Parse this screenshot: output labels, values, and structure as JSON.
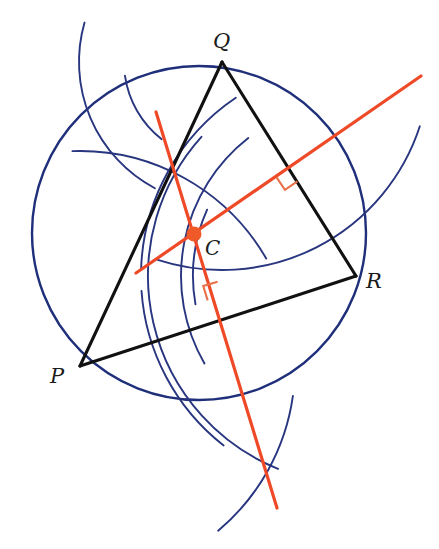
{
  "figure": {
    "background": "#ffffff",
    "width": 439,
    "height": 549,
    "colors": {
      "triangle_stroke": "#111111",
      "circle_stroke": "#1f2f7a",
      "arc_stroke": "#28357f",
      "bisector_stroke": "#ef4a28",
      "center_dot_fill": "#f05a28",
      "right_angle_stroke": "#e8714a",
      "label_fill": "#1b1b1b"
    }
  },
  "labels": {
    "vertex_p": "P",
    "vertex_q": "Q",
    "vertex_r": "R",
    "center": "C"
  },
  "chart_data": {
    "type": "diagram",
    "points": {
      "P": {
        "x": 80,
        "y": 366
      },
      "Q": {
        "x": 222,
        "y": 62
      },
      "R": {
        "x": 356,
        "y": 276
      },
      "C": {
        "x": 194,
        "y": 234
      }
    },
    "label_positions": {
      "P": {
        "x": 50,
        "y": 383
      },
      "Q": {
        "x": 213,
        "y": 48
      },
      "R": {
        "x": 366,
        "y": 288
      },
      "C": {
        "x": 205,
        "y": 255
      }
    },
    "circumcircle": {
      "cx": 199,
      "cy": 233,
      "r": 167,
      "stroke": "#1f2f7a",
      "stroke_width": 2.4
    },
    "triangle_sides": [
      {
        "name": "PQ",
        "from": "P",
        "to": "Q"
      },
      {
        "name": "QR",
        "from": "Q",
        "to": "R"
      },
      {
        "name": "PR",
        "from": "P",
        "to": "R"
      }
    ],
    "perpendicular_bisectors": [
      {
        "name": "bisector-of-QR",
        "bisects": "QR",
        "x1": 136,
        "y1": 273,
        "x2": 421,
        "y2": 76,
        "stroke": "#ef4a28",
        "stroke_width": 3.2
      },
      {
        "name": "bisector-of-PR",
        "bisects": "PR",
        "x1": 156,
        "y1": 112,
        "x2": 277,
        "y2": 508,
        "stroke": "#ef4a28",
        "stroke_width": 3.2
      }
    ],
    "right_angle_markers": [
      {
        "name": "right-angle-on-QR",
        "vertex_x": 289,
        "vertex_y": 169,
        "size": 15,
        "rotation": -34
      },
      {
        "name": "right-angle-on-PR",
        "vertex_x": 222,
        "vertex_y": 296,
        "size": 15,
        "rotation": 73
      }
    ],
    "construction_arcs": [
      {
        "name": "arc-from-Q-large",
        "cx": 222,
        "cy": 62,
        "r": 208,
        "start_deg": 18,
        "end_deg": 108
      },
      {
        "name": "arc-from-R-large",
        "cx": 356,
        "cy": 276,
        "r": 208,
        "start_deg": 112,
        "end_deg": 222
      },
      {
        "name": "arc-from-Q-small",
        "cx": 222,
        "cy": 62,
        "r": 143,
        "start_deg": 118,
        "end_deg": 196
      },
      {
        "name": "arc-from-R-small",
        "cx": 356,
        "cy": 276,
        "r": 175,
        "start_deg": 150,
        "end_deg": 232
      },
      {
        "name": "arc-from-P-upper",
        "cx": 80,
        "cy": 366,
        "r": 215,
        "start_deg": 268,
        "end_deg": 330
      },
      {
        "name": "arc-from-P-lower",
        "cx": 80,
        "cy": 366,
        "r": 215,
        "start_deg": 8,
        "end_deg": 50
      },
      {
        "name": "arc-from-R-upper",
        "cx": 356,
        "cy": 276,
        "r": 215,
        "start_deg": 182,
        "end_deg": 236
      },
      {
        "name": "arc-from-R-lower",
        "cx": 356,
        "cy": 276,
        "r": 215,
        "start_deg": 128,
        "end_deg": 176
      },
      {
        "name": "arc-short-upper-left",
        "cx": 222,
        "cy": 62,
        "r": 98,
        "start_deg": 128,
        "end_deg": 172
      },
      {
        "name": "arc-short-near-center",
        "cx": 356,
        "cy": 276,
        "r": 163,
        "start_deg": 170,
        "end_deg": 204
      }
    ],
    "arc_intersections": [
      {
        "name": "upper-right-crossing",
        "x": 389,
        "y": 99
      },
      {
        "name": "lower-crossing",
        "x": 264,
        "y": 463
      },
      {
        "name": "upper-left-crossing",
        "x": 178,
        "y": 166
      }
    ],
    "center_dot": {
      "x": 194,
      "y": 234,
      "r": 7.5
    }
  }
}
